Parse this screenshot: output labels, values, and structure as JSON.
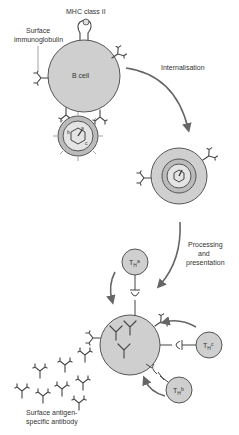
{
  "diagram": {
    "labels": {
      "mhc": "MHC class II",
      "surface_ig_1": "Surface",
      "surface_ig_2": "immunoglobulin",
      "bcell": "B cell",
      "internalisation": "Internalisation",
      "processing_1": "Processing",
      "processing_2": "and",
      "processing_3": "presentation",
      "tha": "a",
      "thb": "b",
      "thc": "c",
      "th_prefix": "T",
      "th_sub": "H",
      "antibody_1": "Surface antigen-",
      "antibody_2": "specific antibody",
      "epitope_a": "a",
      "epitope_b": "b",
      "epitope_c": "c"
    },
    "colors": {
      "cell_fill": "#cfcfcf",
      "stroke": "#555555",
      "arrow": "#666666"
    }
  }
}
